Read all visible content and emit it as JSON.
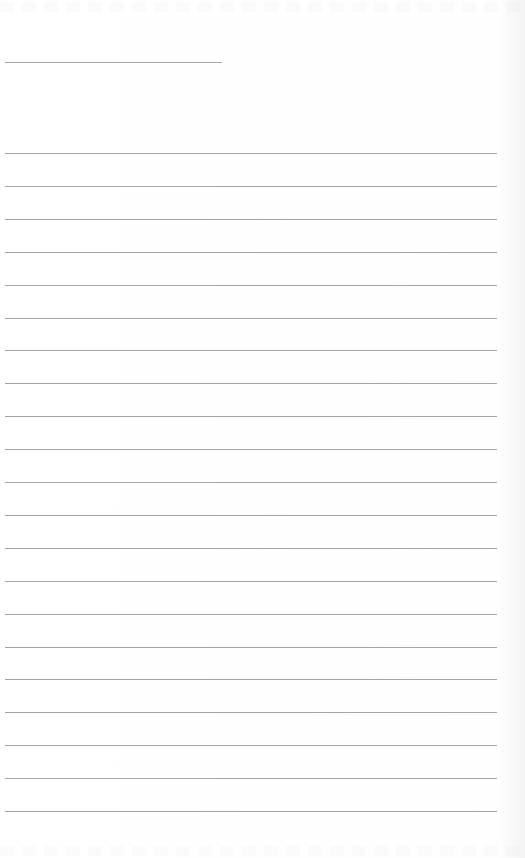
{
  "document": {
    "type": "lined-paper",
    "header_line": {
      "present": true
    },
    "ruled_lines": {
      "count": 21
    },
    "line_color": "#a6a6a6",
    "background_color": "#ffffff"
  }
}
